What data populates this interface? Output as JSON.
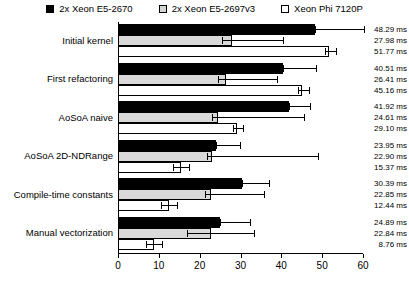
{
  "chart_data": {
    "type": "bar",
    "orientation": "horizontal",
    "title": "",
    "xlabel": "",
    "ylabel": "",
    "xlim": [
      0,
      60
    ],
    "xticks": [
      0,
      10,
      20,
      30,
      40,
      50,
      60
    ],
    "xtick_labels": [
      "0",
      "10",
      "20",
      "30",
      "40",
      "50",
      "60"
    ],
    "grid": false,
    "legend_position": "top",
    "unit": "ms",
    "categories": [
      "Initial kernel",
      "First refactoring",
      "AoSoA naive",
      "AoSoA 2D-NDRange",
      "Compile-time constants",
      "Manual vectorization"
    ],
    "series": [
      {
        "name": "2x Xeon E5-2670",
        "color": "#000000",
        "swatch": "sw-black",
        "values": [
          48.29,
          40.51,
          41.92,
          23.95,
          30.39,
          24.89
        ],
        "errors": [
          12.0,
          8.0,
          5.0,
          6.0,
          6.5,
          7.5
        ]
      },
      {
        "name": "2x Xeon E5-2697v3",
        "color": "#d9d9d9",
        "swatch": "sw-gray",
        "values": [
          27.98,
          26.41,
          24.61,
          22.9,
          22.85,
          22.84
        ],
        "errors_low": [
          2.5,
          2.0,
          1.5,
          1.0,
          1.5,
          6.0
        ],
        "errors": [
          12.5,
          12.5,
          21.0,
          26.0,
          13.0,
          10.5
        ]
      },
      {
        "name": "Xeon Phi 7120P",
        "color": "#ffffff",
        "swatch": "sw-white",
        "values": [
          51.77,
          45.16,
          29.1,
          15.37,
          12.44,
          8.76
        ],
        "errors_low": [
          1.0,
          1.0,
          1.0,
          2.0,
          2.0,
          2.0
        ],
        "errors": [
          1.5,
          1.5,
          1.5,
          2.0,
          2.0,
          2.0
        ]
      }
    ],
    "value_labels": [
      [
        "48.29 ms",
        "27.98 ms",
        "51.77 ms"
      ],
      [
        "40.51 ms",
        "26.41 ms",
        "45.16 ms"
      ],
      [
        "41.92 ms",
        "24.61 ms",
        "29.10 ms"
      ],
      [
        "23.95 ms",
        "22.90 ms",
        "15.37 ms"
      ],
      [
        "30.39 ms",
        "22.85 ms",
        "12.44 ms"
      ],
      [
        "24.89 ms",
        "22.84 ms",
        "8.76 ms"
      ]
    ]
  }
}
